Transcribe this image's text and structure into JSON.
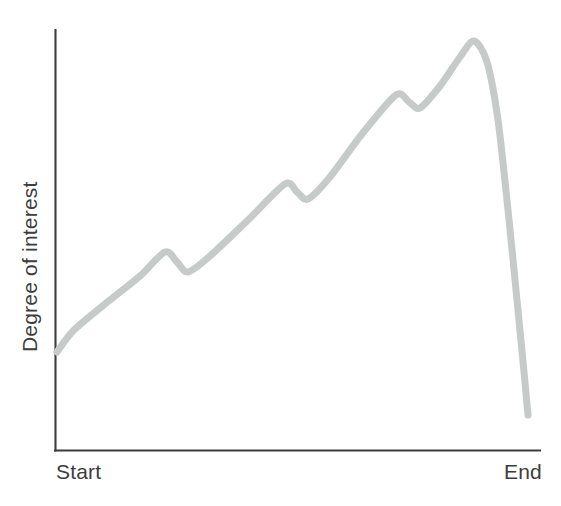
{
  "figure": {
    "width": 561,
    "height": 506,
    "background_color": "#ffffff"
  },
  "axes": {
    "line_color": "#3c3c3c",
    "y_axis": {
      "x": 55,
      "y_top": 30,
      "y_bottom": 450
    },
    "x_axis": {
      "y": 450,
      "x_left": 55,
      "x_right": 540
    }
  },
  "labels": {
    "ylabel": "Degree of interest",
    "xlabel_start": "Start",
    "xlabel_end": "End",
    "text_color": "#3d3d3d"
  },
  "chart_data": {
    "type": "line",
    "title": "",
    "xlabel": "",
    "ylabel": "Degree of interest",
    "x_tick_labels": [
      "Start",
      "End"
    ],
    "y_tick_labels": [],
    "grid": false,
    "legend": null,
    "axis_style": "left-and-bottom spines only, no ticks, no numeric scale",
    "series": [
      {
        "name": "Degree of interest",
        "color": "#c6cac8",
        "line_width": 7,
        "smooth": true,
        "description": "Interest rises overall from Start with three sawtooth dips, reaches a maximum just before End, then drops off very steeply.",
        "points_px": [
          [
            57,
            352
          ],
          [
            74,
            330
          ],
          [
            110,
            300
          ],
          [
            140,
            276
          ],
          [
            165,
            252
          ],
          [
            177,
            262
          ],
          [
            188,
            272
          ],
          [
            210,
            256
          ],
          [
            248,
            220
          ],
          [
            285,
            184
          ],
          [
            297,
            192
          ],
          [
            308,
            199
          ],
          [
            330,
            177
          ],
          [
            362,
            134
          ],
          [
            396,
            95
          ],
          [
            409,
            102
          ],
          [
            420,
            108
          ],
          [
            440,
            86
          ],
          [
            460,
            57
          ],
          [
            474,
            41
          ],
          [
            487,
            62
          ],
          [
            498,
            120
          ],
          [
            508,
            210
          ],
          [
            517,
            300
          ],
          [
            524,
            372
          ],
          [
            528,
            415
          ]
        ],
        "normalized": {
          "x": [
            0.0,
            0.04,
            0.11,
            0.18,
            0.23,
            0.25,
            0.27,
            0.32,
            0.39,
            0.47,
            0.5,
            0.52,
            0.57,
            0.63,
            0.7,
            0.73,
            0.75,
            0.79,
            0.83,
            0.86,
            0.89,
            0.91,
            0.93,
            0.95,
            0.96,
            0.97
          ],
          "y": [
            0.23,
            0.29,
            0.36,
            0.41,
            0.47,
            0.45,
            0.42,
            0.46,
            0.55,
            0.63,
            0.61,
            0.6,
            0.65,
            0.75,
            0.85,
            0.83,
            0.81,
            0.87,
            0.94,
            0.97,
            0.92,
            0.79,
            0.57,
            0.36,
            0.19,
            0.08
          ]
        }
      }
    ],
    "xlim": [
      55,
      540
    ],
    "ylim": [
      450,
      30
    ],
    "annotations": []
  }
}
